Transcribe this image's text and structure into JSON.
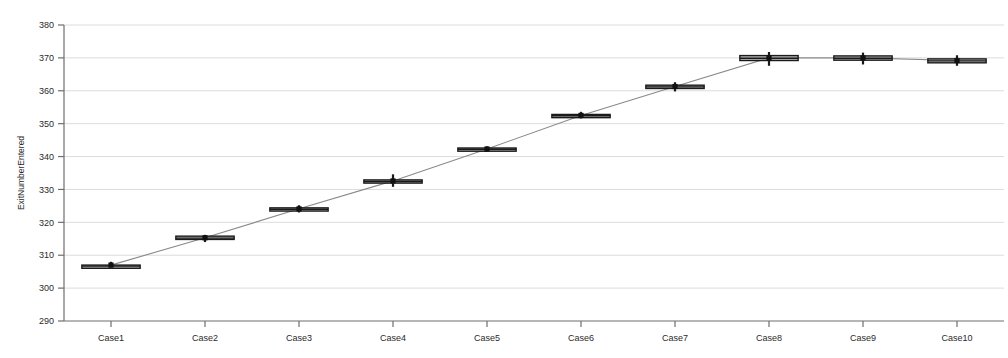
{
  "chart_data": {
    "type": "box",
    "title": "",
    "xlabel": "",
    "ylabel": "ExitNumberEntered",
    "categories": [
      "Case1",
      "Case2",
      "Case3",
      "Case4",
      "Case5",
      "Case6",
      "Case7",
      "Case8",
      "Case9",
      "Case10"
    ],
    "ylim": [
      290,
      380
    ],
    "ytick_labels": [
      "290",
      "300",
      "310",
      "320",
      "330",
      "340",
      "350",
      "360",
      "370",
      "380"
    ],
    "ytick_values": [
      290,
      300,
      310,
      320,
      330,
      340,
      350,
      360,
      370,
      380
    ],
    "grid": true,
    "legend": "none",
    "connector_line": {
      "style": "solid",
      "color": "#8a8a8a",
      "connects": "means"
    },
    "boxes": [
      {
        "category": "Case1",
        "whisker_low": 306.2,
        "q1": 306.4,
        "median": 306.7,
        "mean": 307.0,
        "q3": 307.0,
        "whisker_high": 308.0
      },
      {
        "category": "Case2",
        "whisker_low": 314.0,
        "q1": 314.8,
        "median": 315.2,
        "mean": 315.3,
        "q3": 315.8,
        "whisker_high": 316.2
      },
      {
        "category": "Case3",
        "whisker_low": 323.0,
        "q1": 323.6,
        "median": 324.0,
        "mean": 324.1,
        "q3": 324.4,
        "whisker_high": 325.2
      },
      {
        "category": "Case4",
        "whisker_low": 330.8,
        "q1": 332.0,
        "median": 332.4,
        "mean": 332.6,
        "q3": 332.9,
        "whisker_high": 334.6
      },
      {
        "category": "Case5",
        "whisker_low": 341.4,
        "q1": 341.9,
        "median": 342.2,
        "mean": 342.3,
        "q3": 342.6,
        "whisker_high": 343.1
      },
      {
        "category": "Case6",
        "whisker_low": 351.6,
        "q1": 352.1,
        "median": 352.4,
        "mean": 352.5,
        "q3": 352.8,
        "whisker_high": 353.6
      },
      {
        "category": "Case7",
        "whisker_low": 359.8,
        "q1": 360.7,
        "median": 361.2,
        "mean": 361.3,
        "q3": 361.7,
        "whisker_high": 362.6
      },
      {
        "category": "Case8",
        "whisker_low": 367.6,
        "q1": 369.2,
        "median": 369.9,
        "mean": 370.0,
        "q3": 370.7,
        "whisker_high": 371.8
      },
      {
        "category": "Case9",
        "whisker_low": 368.0,
        "q1": 369.3,
        "median": 369.9,
        "mean": 370.0,
        "q3": 370.6,
        "whisker_high": 371.6
      },
      {
        "category": "Case10",
        "whisker_low": 367.6,
        "q1": 368.5,
        "median": 369.1,
        "mean": 369.2,
        "q3": 369.7,
        "whisker_high": 370.8
      }
    ],
    "colors": {
      "box_fill": "#b0b0b0",
      "box_stroke": "#1a1a1a",
      "median": "#1a1a1a",
      "mean_marker": "#111111",
      "whisker": "#1a1a1a",
      "grid": "#dcdcdc",
      "axis": "#6e6e6e",
      "background": "#ffffff"
    }
  }
}
